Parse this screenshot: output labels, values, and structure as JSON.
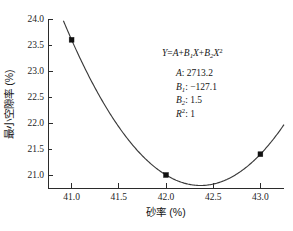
{
  "chart_data": {
    "type": "line",
    "title": "",
    "xlabel": "砂率 (%)",
    "ylabel": "最小空隙率 (%)",
    "xlim": [
      40.75,
      43.25
    ],
    "ylim": [
      20.75,
      24.0
    ],
    "grid": false,
    "legend": "none",
    "x_ticks": [
      "41.0",
      "41.5",
      "42.0",
      "42.5",
      "43.0"
    ],
    "x_tick_values": [
      41.0,
      41.5,
      42.0,
      42.5,
      43.0
    ],
    "y_ticks": [
      "24.0",
      "23.5",
      "23.0",
      "22.5",
      "22.0",
      "21.5",
      "21.0"
    ],
    "y_tick_values": [
      24.0,
      23.5,
      23.0,
      22.5,
      22.0,
      21.5,
      21.0
    ],
    "series": [
      {
        "name": "最小空隙率",
        "marker": "filled-square",
        "x": [
          41.0,
          42.0,
          43.0
        ],
        "values": [
          23.6,
          21.0,
          21.4
        ]
      }
    ],
    "fit": {
      "model": "quadratic",
      "A": 2713.2,
      "B1": -127.1,
      "B2": 1.5,
      "R2": 1,
      "vertex_x": 42.37,
      "vertex_y": 20.86
    },
    "annotation": {
      "formula_y": "Y",
      "formula_eq": "=",
      "formula_a": "A",
      "formula_plus1": "+",
      "formula_b1": "B",
      "formula_b1_sub": "1",
      "formula_x1": "X",
      "formula_plus2": "+",
      "formula_b2": "B",
      "formula_b2_sub": "2",
      "formula_x2": "X",
      "formula_x2_sup": "2",
      "rows": [
        {
          "symbol": "A",
          "sub": "",
          "sup": "",
          "value": ": 2713.2"
        },
        {
          "symbol": "B",
          "sub": "1",
          "sup": "",
          "value": ": −127.1"
        },
        {
          "symbol": "B",
          "sub": "2",
          "sup": "",
          "value": ": 1.5"
        },
        {
          "symbol": "R",
          "sub": "",
          "sup": "2",
          "value": ": 1"
        }
      ]
    }
  },
  "axes": {
    "x_axis_name": "砂率 (%)",
    "y_axis_name": "最小空隙率 (%)"
  },
  "colors": {
    "curve": "#3a3a3a",
    "marker": "#111111",
    "axis": "#2b2b2b",
    "text": "#161616",
    "background": "#ffffff"
  }
}
